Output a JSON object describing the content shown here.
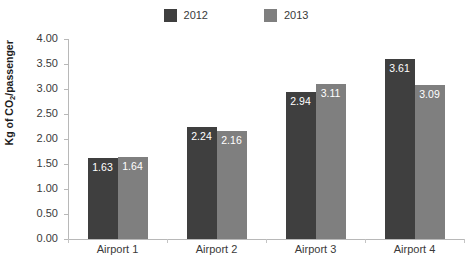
{
  "chart_data": {
    "type": "bar",
    "title": "",
    "subtitle": "",
    "xlabel": "",
    "ylabel": "Kg of CO2/passenger",
    "ylabel_parts": {
      "pre": "Kg of CO",
      "sub": "2",
      "post": "/passenger"
    },
    "categories": [
      "Airport 1",
      "Airport 2",
      "Airport 3",
      "Airport 4"
    ],
    "series": [
      {
        "name": "2012",
        "color": "#3f3f3f",
        "values": [
          1.63,
          2.24,
          2.94,
          3.61
        ]
      },
      {
        "name": "2013",
        "color": "#7f7f7f",
        "values": [
          1.64,
          2.16,
          3.11,
          3.09
        ]
      }
    ],
    "value_labels": {
      "2012": [
        "1.63",
        "2.24",
        "2.94",
        "3.61"
      ],
      "2013": [
        "1.64",
        "2.16",
        "3.11",
        "3.09"
      ]
    },
    "ylim": [
      0.0,
      4.0
    ],
    "ytick_step": 0.5,
    "ytick_labels": [
      "4.00",
      "3.50",
      "3.00",
      "2.50",
      "2.00",
      "1.50",
      "1.00",
      "0.50",
      "0.00"
    ],
    "ytick_values": [
      4.0,
      3.5,
      3.0,
      2.5,
      2.0,
      1.5,
      1.0,
      0.5,
      0.0
    ],
    "grid": false,
    "legend_position": "top-center",
    "legend": [
      "2012",
      "2013"
    ],
    "value_label_color": "#ffffff",
    "axis_color": "#b8b8b8",
    "background": "#ffffff"
  }
}
